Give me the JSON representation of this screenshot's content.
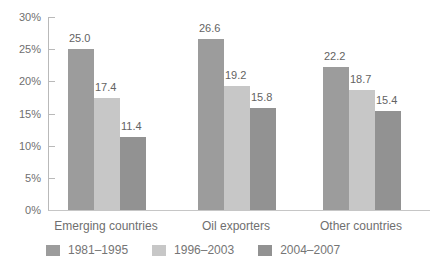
{
  "chart_data": {
    "type": "bar",
    "title": "",
    "xlabel": "",
    "ylabel": "",
    "categories": [
      "Emerging countries",
      "Oil exporters",
      "Other countries"
    ],
    "series": [
      {
        "name": "1981–1995",
        "color": "#9c9c9c",
        "values": [
          25.0,
          26.6,
          22.2
        ]
      },
      {
        "name": "1996–2003",
        "color": "#c7c7c7",
        "values": [
          17.4,
          19.2,
          18.7
        ]
      },
      {
        "name": "2004–2007",
        "color": "#929292",
        "values": [
          11.4,
          15.8,
          15.4
        ]
      }
    ],
    "data_labels": [
      [
        "25.0",
        "17.4",
        "11.4"
      ],
      [
        "26.6",
        "19.2",
        "15.8"
      ],
      [
        "22.2",
        "18.7",
        "15.4"
      ]
    ],
    "ylim": [
      0,
      30
    ],
    "y_ticks": [
      "0%",
      "5%",
      "10%",
      "15%",
      "20%",
      "25%",
      "30%"
    ],
    "grid": false,
    "legend_position": "bottom",
    "colors": {
      "axis_line": "#b9b9b9",
      "baseline": "#c6c6c6",
      "tick_text": "#6f6f6f",
      "value_text": "#636363",
      "category_text": "#6f6f6f",
      "legend_text": "#757575",
      "background": "#ffffff"
    }
  }
}
